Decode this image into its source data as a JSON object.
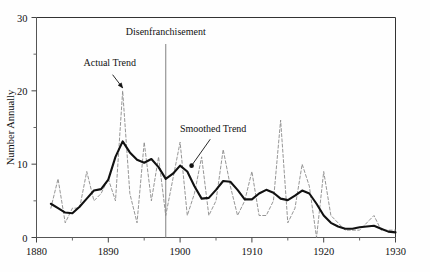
{
  "chart_data": {
    "type": "line",
    "title": "",
    "xlabel": "",
    "ylabel": "Number Annually",
    "xlim": [
      1880,
      1930
    ],
    "ylim": [
      0,
      30
    ],
    "grid": false,
    "legend_position": "none",
    "x_major_ticks": [
      1880,
      1890,
      1900,
      1910,
      1920,
      1930
    ],
    "x_minor_ticks": [
      1885,
      1895,
      1905,
      1915,
      1925
    ],
    "y_major_ticks": [
      0,
      10,
      20,
      30
    ],
    "y_minor_ticks": [
      5,
      15,
      25
    ],
    "x_tick_labels": [
      "1880",
      "1890",
      "1900",
      "1910",
      "1920",
      "1930"
    ],
    "y_tick_labels": [
      "0",
      "10",
      "20",
      "30"
    ],
    "annotations": [
      {
        "name": "actual-trend-annotation",
        "text": "Actual Trend",
        "text_x": 1890.2,
        "text_y": 23.4,
        "pointer_from_x": 1890.6,
        "pointer_from_y": 22.2,
        "pointer_to_x": 1892.0,
        "pointer_to_y": 20.4,
        "arrow": true
      },
      {
        "name": "disenfranchisement-annotation",
        "text": "Disenfranchisement",
        "text_x": 1898.0,
        "text_y": 27.6,
        "vline_x": 1898.0,
        "vline_y_top": 26.4,
        "vline_y_bottom": 0,
        "arrow": false
      },
      {
        "name": "smoothed-trend-annotation",
        "text": "Smoothed Trend",
        "text_x": 1904.6,
        "text_y": 14.4,
        "pointer_from_x": 1904.2,
        "pointer_from_y": 13.4,
        "pointer_to_x": 1901.6,
        "pointer_to_y": 9.8,
        "marker": true,
        "arrow": false
      }
    ],
    "series": [
      {
        "name": "Actual Trend",
        "style": "dashed",
        "color": "#8a8a8a",
        "x": [
          1882,
          1883,
          1884,
          1885,
          1886,
          1887,
          1888,
          1889,
          1890,
          1891,
          1892,
          1893,
          1894,
          1895,
          1896,
          1897,
          1898,
          1899,
          1900,
          1901,
          1902,
          1903,
          1904,
          1905,
          1906,
          1907,
          1908,
          1909,
          1910,
          1911,
          1912,
          1913,
          1914,
          1915,
          1916,
          1917,
          1918,
          1919,
          1920,
          1921,
          1922,
          1923,
          1924,
          1925,
          1926,
          1927,
          1928,
          1929,
          1930
        ],
        "values": [
          4,
          8,
          2,
          4,
          4,
          9,
          5,
          6,
          8,
          5,
          20,
          6,
          2,
          13,
          5,
          11,
          3,
          8,
          13,
          3,
          6,
          11,
          3,
          5,
          12,
          7,
          3,
          5,
          9,
          3,
          3,
          5,
          16,
          2,
          4,
          10,
          7,
          0,
          9,
          3,
          2,
          1,
          1,
          1,
          2,
          3,
          1,
          1,
          1
        ]
      },
      {
        "name": "Smoothed Trend",
        "style": "solid",
        "color": "#111111",
        "x": [
          1882,
          1883,
          1884,
          1885,
          1886,
          1887,
          1888,
          1889,
          1890,
          1891,
          1892,
          1893,
          1894,
          1895,
          1896,
          1897,
          1898,
          1899,
          1900,
          1901,
          1902,
          1903,
          1904,
          1905,
          1906,
          1907,
          1908,
          1909,
          1910,
          1911,
          1912,
          1913,
          1914,
          1915,
          1916,
          1917,
          1918,
          1919,
          1920,
          1921,
          1922,
          1923,
          1924,
          1925,
          1926,
          1927,
          1928,
          1929,
          1930
        ],
        "values": [
          4.6,
          4.0,
          3.4,
          3.3,
          4.2,
          5.3,
          6.4,
          6.6,
          7.9,
          11.0,
          13.1,
          11.6,
          10.6,
          10.2,
          10.7,
          9.6,
          8.0,
          8.7,
          9.8,
          9.0,
          7.0,
          5.3,
          5.4,
          6.5,
          7.7,
          7.6,
          6.5,
          5.2,
          5.2,
          6.0,
          6.5,
          6.1,
          5.3,
          5.1,
          5.7,
          6.4,
          6.0,
          4.6,
          3.0,
          2.0,
          1.5,
          1.2,
          1.2,
          1.4,
          1.5,
          1.6,
          1.2,
          0.8,
          0.7
        ]
      }
    ]
  },
  "axis": {
    "ylabel": "Number Annually"
  }
}
